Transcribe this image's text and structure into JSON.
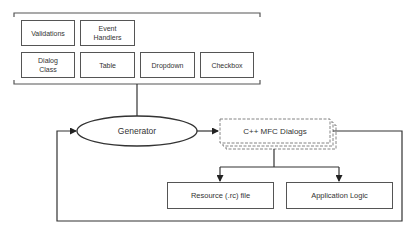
{
  "diagram": {
    "components_group": {
      "items": [
        {
          "label": "Validations"
        },
        {
          "label": "Event\nHandlers"
        },
        {
          "label": "Dialog\nClass"
        },
        {
          "label": "Table"
        },
        {
          "label": "Dropdown"
        },
        {
          "label": "Checkbox"
        }
      ]
    },
    "generator": {
      "label": "Generator"
    },
    "output": {
      "label": "C++ MFC Dialogs"
    },
    "artifacts": [
      {
        "label": "Resource (.rc) file"
      },
      {
        "label": "Application Logic"
      }
    ],
    "colors": {
      "stroke": "#444444",
      "background": "#ffffff",
      "text": "#333333"
    }
  }
}
